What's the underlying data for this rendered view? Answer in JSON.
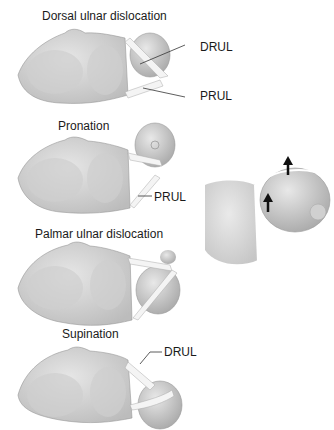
{
  "panels": [
    {
      "caption": "Dorsal ulnar dislocation",
      "labels": [
        "DRUL",
        "PRUL"
      ]
    },
    {
      "caption": "Pronation",
      "labels": [
        "PRUL"
      ]
    },
    {
      "caption": "Palmar ulnar dislocation",
      "labels": []
    },
    {
      "caption": "Supination",
      "labels": [
        "DRUL"
      ]
    }
  ],
  "detail_panel": {
    "arrows": 2,
    "arrow_direction": "up"
  },
  "colors": {
    "bone": "#d9d9d9",
    "bone_shadow": "#bdbdbd",
    "ligament": "#f4f4f4",
    "leader": "#333333"
  }
}
